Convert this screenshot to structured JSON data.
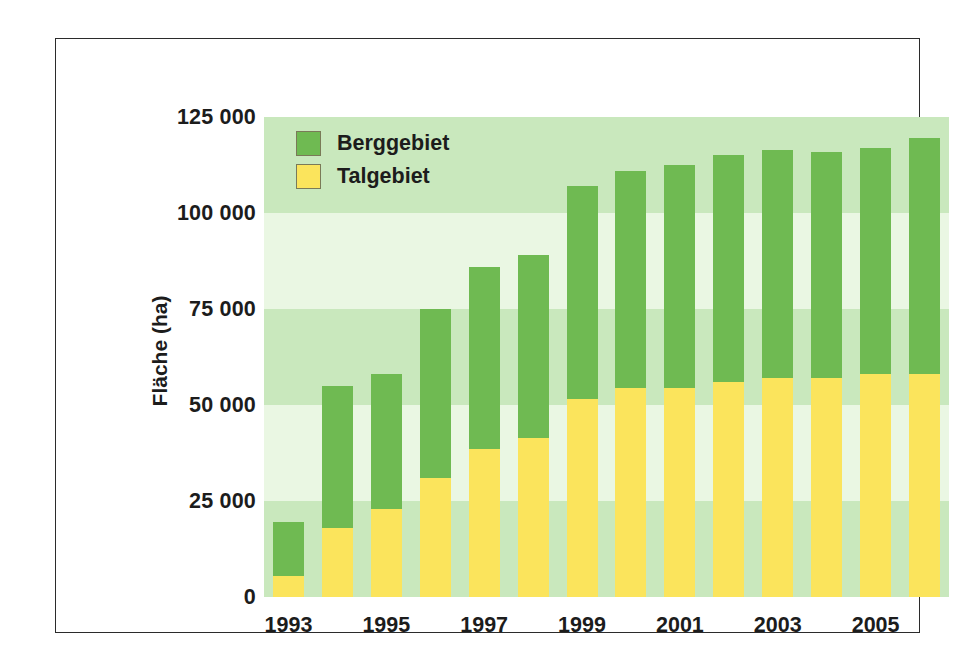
{
  "chart_data": {
    "type": "bar",
    "stacked": true,
    "title": "",
    "xlabel": "",
    "ylabel": "Fläche (ha)",
    "ylim": [
      0,
      125000
    ],
    "ytick_values": [
      0,
      25000,
      50000,
      75000,
      100000,
      125000
    ],
    "ytick_labels": [
      "0",
      "25 000",
      "50 000",
      "75 000",
      "100 000",
      "125 000"
    ],
    "categories": [
      1993,
      1994,
      1995,
      1996,
      1997,
      1998,
      1999,
      2000,
      2001,
      2002,
      2003,
      2004,
      2005,
      2006
    ],
    "xtick_labels": [
      "1993",
      "1995",
      "1997",
      "1999",
      "2001",
      "2003",
      "2005"
    ],
    "xtick_categories": [
      1993,
      1995,
      1997,
      1999,
      2001,
      2003,
      2005
    ],
    "series": [
      {
        "name": "Talgebiet",
        "color": "#fbe45c",
        "values": [
          5500,
          18000,
          23000,
          31000,
          38500,
          41500,
          51500,
          54500,
          54500,
          56000,
          57000,
          57000,
          58000,
          58000
        ]
      },
      {
        "name": "Berggebiet",
        "color": "#6fba52",
        "values": [
          14000,
          37000,
          35000,
          44000,
          47500,
          47500,
          55500,
          56500,
          58000,
          59000,
          59500,
          59000,
          59000,
          61500
        ]
      }
    ],
    "totals": [
      19500,
      55000,
      58000,
      75000,
      86000,
      89000,
      107000,
      111000,
      112500,
      115000,
      116500,
      116000,
      117000,
      119500
    ],
    "grid": "horizontal-bands",
    "band_colors": [
      "#c9e8bd",
      "#eaf7e3"
    ],
    "legend_position": "top-left",
    "legend": [
      {
        "label": "Berggebiet",
        "color": "#6fba52"
      },
      {
        "label": "Talgebiet",
        "color": "#fbe45c"
      }
    ],
    "frame_color": "#2b2b2b"
  }
}
